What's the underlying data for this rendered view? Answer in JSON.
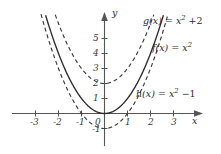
{
  "chart_data": {
    "type": "line",
    "title": "",
    "xlabel": "x",
    "ylabel": "y",
    "xlim": [
      -3.9,
      4.3
    ],
    "ylim": [
      -1.9,
      6.6
    ],
    "grid": false,
    "legend_position": "right-inline",
    "x_ticks": [
      "-3",
      "-2",
      "-1",
      "0",
      "1",
      "2",
      "3"
    ],
    "x_tick_values": [
      -3,
      -2,
      -1,
      0,
      1,
      2,
      3
    ],
    "y_ticks": [
      "-1",
      "1",
      "2",
      "3",
      "4",
      "5"
    ],
    "y_tick_values": [
      -1,
      1,
      2,
      3,
      4,
      5
    ],
    "origin_label": "0",
    "series": [
      {
        "name": "g",
        "equation": "g(x) = x^2 + 2",
        "style": "dashed",
        "color": "#3a3a3a",
        "vertex": [
          0,
          2
        ],
        "formula_offset": 2,
        "label_lhs": "g(x)",
        "label_eq": "=",
        "label_base": "x",
        "label_exp": "2",
        "label_op": "+",
        "label_const": "2"
      },
      {
        "name": "f",
        "equation": "f(x) = x^2",
        "style": "solid",
        "color": "#2b2b2b",
        "vertex": [
          0,
          0
        ],
        "formula_offset": 0,
        "label_lhs": "f(x)",
        "label_eq": "=",
        "label_base": "x",
        "label_exp": "2",
        "label_op": "",
        "label_const": ""
      },
      {
        "name": "h",
        "equation": "h(x) = x^2 - 1",
        "style": "dashed",
        "color": "#3a3a3a",
        "vertex": [
          0,
          -1
        ],
        "formula_offset": -1,
        "label_lhs": "h(x)",
        "label_eq": "=",
        "label_base": "x",
        "label_exp": "2",
        "label_op": "−",
        "label_const": "1"
      }
    ]
  },
  "axes": {
    "x_axis_name": "x",
    "y_axis_name": "y"
  }
}
